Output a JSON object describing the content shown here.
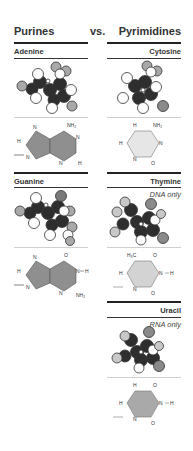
{
  "header": {
    "left": "Purines",
    "middle": "vs.",
    "right": "Pyrimidines"
  },
  "purines": [
    {
      "name": "Adenine",
      "note": "",
      "ring_color": "#8f8f8f",
      "atoms": {
        "N1": "N",
        "N3": "N",
        "N7": "N",
        "N9": "N",
        "H2": "H",
        "H8": "H",
        "C6_sub": "NH₂"
      }
    },
    {
      "name": "Guanine",
      "note": "",
      "ring_color": "#8f8f8f",
      "atoms": {
        "N1": "N",
        "H1": "H",
        "N3": "N",
        "N7": "N",
        "N9": "N",
        "H8": "H",
        "C6_sub": "O",
        "C2_sub": "NH₂"
      }
    }
  ],
  "pyrimidines": [
    {
      "name": "Cytosine",
      "note": "",
      "ring_color": "#e6e6e6",
      "atoms": {
        "N1": "N",
        "N3": "N",
        "H5": "H",
        "H6": "H",
        "C4_sub": "NH₂",
        "C2_sub": "O"
      }
    },
    {
      "name": "Thymine",
      "note": "DNA only",
      "ring_color": "#d3d3d3",
      "atoms": {
        "N1": "N",
        "N3": "N",
        "H3": "H",
        "H6": "H",
        "C5_sub": "H₃C",
        "C4_sub": "O",
        "C2_sub": "O"
      }
    },
    {
      "name": "Uracil",
      "note": "RNA only",
      "ring_color": "#a9a9a9",
      "atoms": {
        "N1": "N",
        "N3": "N",
        "H3": "H",
        "H5": "H",
        "H6": "H",
        "C4_sub": "O",
        "C2_sub": "O"
      }
    }
  ],
  "colors": {
    "carbon": "#2e2e2e",
    "hydrogen": "#ffffff",
    "nitrogen_oxygen": "#a8a8a8",
    "oxygen_dark": "#7a7a7a",
    "rule": "#222222",
    "separator": "#cfcfcf"
  }
}
